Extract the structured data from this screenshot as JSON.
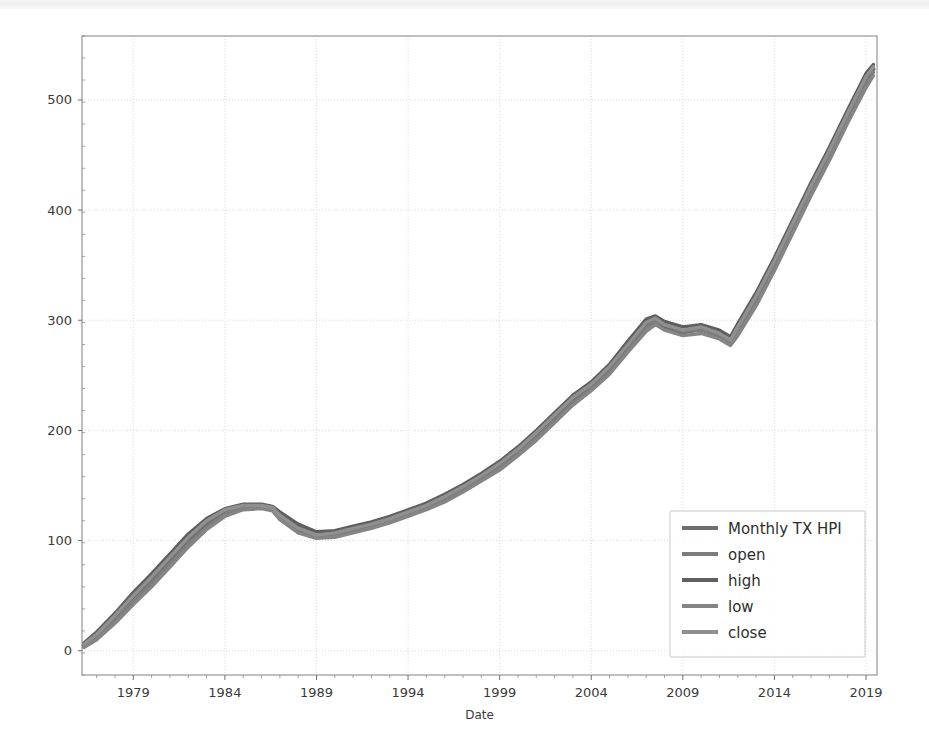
{
  "figure": {
    "background_color": "#ffffff",
    "plot_area": {
      "left": 82,
      "top": 36,
      "right": 877,
      "bottom": 675
    }
  },
  "chart_data": {
    "type": "line",
    "title": "",
    "xlabel": "Date",
    "ylabel": "",
    "grid": true,
    "legend_position": "lower right",
    "xlim": [
      1976.2,
      2019.6
    ],
    "ylim": [
      -22,
      558
    ],
    "xticks": [
      1979,
      1984,
      1989,
      1994,
      1999,
      2004,
      2009,
      2014,
      2019
    ],
    "xtick_labels": [
      "1979",
      "1984",
      "1989",
      "1994",
      "1999",
      "2004",
      "2009",
      "2014",
      "2019"
    ],
    "xtick_minor_step": 1,
    "yticks": [
      0,
      100,
      200,
      300,
      400,
      500
    ],
    "ytick_labels": [
      "0",
      "100",
      "200",
      "300",
      "400",
      "500"
    ],
    "x": [
      1976.3,
      1977,
      1978,
      1979,
      1980,
      1981,
      1982,
      1983,
      1984,
      1985,
      1986,
      1986.6,
      1987,
      1988,
      1989,
      1990,
      1991,
      1992,
      1993,
      1994,
      1995,
      1996,
      1997,
      1998,
      1999,
      2000,
      2001,
      2002,
      2003,
      2004,
      2005,
      2006,
      2007,
      2007.5,
      2008,
      2009,
      2010,
      2011,
      2011.6,
      2012,
      2013,
      2014,
      2015,
      2016,
      2017,
      2018,
      2019,
      2019.4
    ],
    "series": [
      {
        "name": "Monthly TX HPI",
        "color": "#6e6e6e",
        "linewidth": 4.2,
        "values": [
          5,
          14,
          30,
          48,
          64,
          82,
          100,
          115,
          126,
          131,
          131,
          129,
          122,
          110,
          104,
          106,
          110,
          114,
          119,
          125,
          131,
          139,
          148,
          158,
          168,
          181,
          196,
          212,
          228,
          240,
          256,
          276,
          296,
          300,
          294,
          289,
          292,
          286,
          280,
          292,
          320,
          352,
          386,
          420,
          452,
          486,
          518,
          528
        ]
      },
      {
        "name": "open",
        "color": "#7d7d7d",
        "linewidth": 3.4,
        "values": [
          4,
          12,
          27,
          45,
          61,
          79,
          97,
          112,
          124,
          130,
          131,
          130,
          124,
          112,
          105,
          105,
          109,
          113,
          118,
          124,
          130,
          137,
          146,
          156,
          166,
          179,
          193,
          209,
          225,
          238,
          253,
          273,
          293,
          299,
          296,
          290,
          291,
          287,
          280,
          289,
          316,
          348,
          382,
          416,
          448,
          482,
          514,
          525
        ]
      },
      {
        "name": "high",
        "color": "#5f5f5f",
        "linewidth": 3.4,
        "values": [
          7,
          17,
          34,
          53,
          70,
          88,
          106,
          120,
          129,
          133,
          133,
          131,
          126,
          115,
          108,
          109,
          113,
          117,
          122,
          128,
          134,
          142,
          151,
          161,
          172,
          185,
          200,
          216,
          232,
          244,
          260,
          281,
          301,
          304,
          299,
          294,
          296,
          291,
          285,
          297,
          325,
          357,
          391,
          425,
          457,
          491,
          524,
          532
        ]
      },
      {
        "name": "low",
        "color": "#858585",
        "linewidth": 3.4,
        "values": [
          3,
          10,
          25,
          42,
          58,
          76,
          94,
          110,
          122,
          128,
          129,
          127,
          119,
          107,
          102,
          103,
          107,
          111,
          116,
          122,
          128,
          135,
          144,
          154,
          164,
          177,
          191,
          207,
          223,
          236,
          251,
          271,
          290,
          296,
          291,
          286,
          288,
          283,
          277,
          286,
          313,
          345,
          379,
          413,
          445,
          479,
          511,
          522
        ]
      },
      {
        "name": "close",
        "color": "#909090",
        "linewidth": 3.4,
        "values": [
          6,
          15,
          32,
          50,
          67,
          85,
          103,
          118,
          128,
          132,
          132,
          130,
          123,
          111,
          105,
          107,
          111,
          115,
          120,
          126,
          132,
          140,
          149,
          159,
          170,
          183,
          198,
          214,
          230,
          242,
          258,
          278,
          298,
          302,
          296,
          291,
          294,
          288,
          282,
          294,
          322,
          354,
          388,
          422,
          454,
          488,
          521,
          530
        ]
      }
    ]
  },
  "legend": {
    "entries": [
      {
        "label": "Monthly TX HPI",
        "color": "#6e6e6e"
      },
      {
        "label": "open",
        "color": "#7d7d7d"
      },
      {
        "label": "high",
        "color": "#5f5f5f"
      },
      {
        "label": "low",
        "color": "#858585"
      },
      {
        "label": "close",
        "color": "#909090"
      }
    ]
  }
}
